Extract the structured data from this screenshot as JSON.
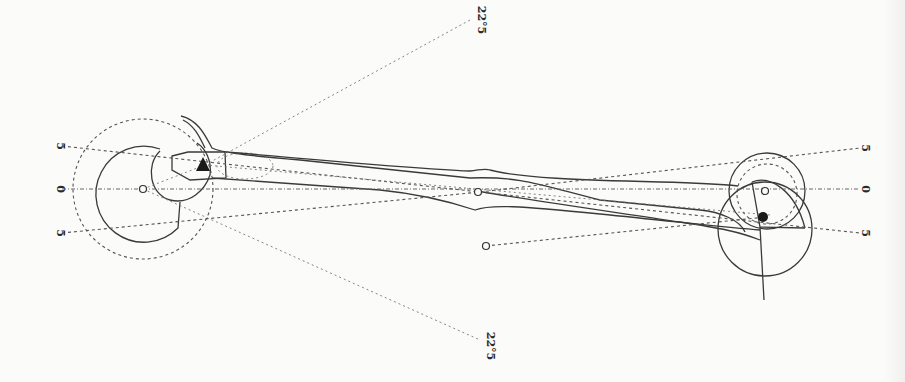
{
  "diagram": {
    "type": "mechanical-lever-geometry-drawing",
    "background_color": "#fbfbfa",
    "ink_color": "#3a3a3a",
    "left_labels": [
      {
        "text": "5",
        "position": "upper"
      },
      {
        "text": "0",
        "position": "middle"
      },
      {
        "text": "5",
        "position": "lower"
      }
    ],
    "right_labels": [
      {
        "text": "5",
        "position": "upper"
      },
      {
        "text": "0",
        "position": "middle"
      },
      {
        "text": "5",
        "position": "lower"
      }
    ],
    "angle_labels": {
      "top": "22°5",
      "bottom": "22°5"
    },
    "markers": {
      "left_pivot": "open-circle",
      "center_pivot": "open-circle",
      "lower_center_point": "open-circle",
      "right_pivot": "open-circle",
      "left_contact": "filled-triangle",
      "right_contact": "filled-circle"
    }
  }
}
